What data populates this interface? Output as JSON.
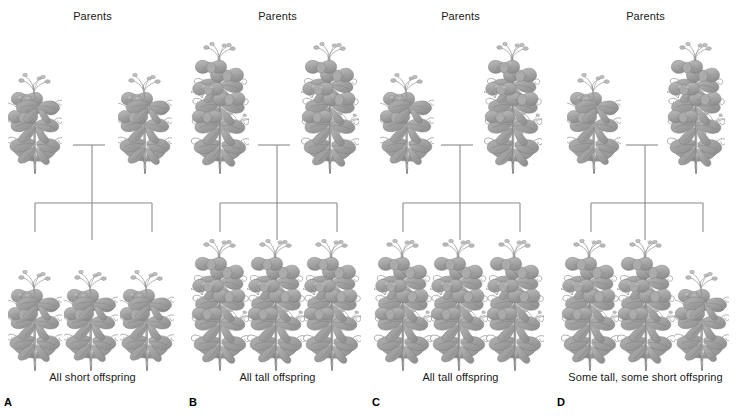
{
  "figure": {
    "background_color": "#ffffff",
    "text_color": "#1a1a1a",
    "line_color": "#8a8a8a",
    "plant_color": "#9a9a9a"
  },
  "panels": [
    {
      "letter": "A",
      "parents_label": "Parents",
      "offspring_label": "All short offspring",
      "parents": [
        "short",
        "short"
      ],
      "offspring": [
        "short",
        "short",
        "short"
      ]
    },
    {
      "letter": "B",
      "parents_label": "Parents",
      "offspring_label": "All tall offspring",
      "parents": [
        "tall",
        "tall"
      ],
      "offspring": [
        "tall",
        "tall",
        "tall"
      ]
    },
    {
      "letter": "C",
      "parents_label": "Parents",
      "offspring_label": "All tall offspring",
      "parents": [
        "short",
        "tall"
      ],
      "offspring": [
        "tall",
        "tall",
        "tall"
      ]
    },
    {
      "letter": "D",
      "parents_label": "Parents",
      "offspring_label": "Some tall, some short offspring",
      "parents": [
        "short",
        "tall"
      ],
      "offspring": [
        "tall",
        "tall",
        "short"
      ]
    }
  ]
}
